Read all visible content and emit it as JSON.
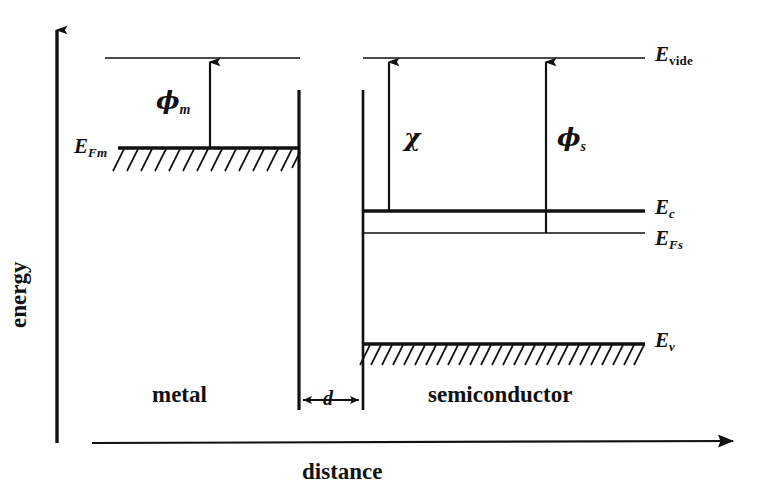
{
  "figure": {
    "type": "energy-band-diagram",
    "background_color": "#ffffff",
    "ink_color": "#111111"
  },
  "axes": {
    "energy_label": "energy",
    "distance_label": "distance",
    "energy_axis": {
      "x": 57,
      "y_top": 20,
      "y_bottom": 443
    },
    "distance_axis": {
      "y": 443,
      "x_left": 92,
      "x_right": 745
    }
  },
  "regions": {
    "metal": {
      "label": "metal",
      "label_x": 152,
      "label_y": 386,
      "x_left": 105,
      "x_right": 299
    },
    "gap": {
      "label": "d",
      "label_x": 322,
      "label_y": 389,
      "x_left": 299,
      "x_right": 363,
      "dim_line_y": 400
    },
    "semiconductor": {
      "label": "semiconductor",
      "label_x": 433,
      "label_y": 386,
      "x_left": 363,
      "x_right": 645
    }
  },
  "levels": [
    {
      "name": "E_vide_metal",
      "label_sym": "E",
      "label_sub": "",
      "y": 58,
      "x_start": 105,
      "x_end": 300,
      "thickness": 1.4,
      "hatched": false,
      "labeled": false
    },
    {
      "name": "E_vide_semiconductor",
      "label_sym": "E",
      "label_sub": "vide",
      "sub_upright": true,
      "y": 58,
      "x_start": 363,
      "x_end": 645,
      "thickness": 1.4,
      "hatched": false,
      "labeled": true,
      "label_x": 655,
      "label_y": 46
    },
    {
      "name": "E_Fm",
      "label_sym": "E",
      "label_sub": "Fm",
      "sub_upright": false,
      "y": 148,
      "x_start": 118,
      "x_end": 299,
      "thickness": 3.2,
      "hatched": true,
      "labeled": true,
      "label_x": 74,
      "label_y": 138
    },
    {
      "name": "E_c",
      "label_sym": "E",
      "label_sub": "c",
      "sub_upright": false,
      "y": 211,
      "x_start": 363,
      "x_end": 645,
      "thickness": 3.4,
      "hatched": false,
      "labeled": true,
      "label_x": 655,
      "label_y": 199
    },
    {
      "name": "E_Fs",
      "label_sym": "E",
      "label_sub": "Fs",
      "sub_upright": false,
      "y": 233,
      "x_start": 363,
      "x_end": 645,
      "thickness": 1.5,
      "hatched": false,
      "labeled": true,
      "label_x": 655,
      "label_y": 230
    },
    {
      "name": "E_v",
      "label_sym": "E",
      "label_sub": "v",
      "sub_upright": false,
      "y": 344,
      "x_start": 363,
      "x_end": 645,
      "thickness": 3.4,
      "hatched": true,
      "labeled": true,
      "label_x": 655,
      "label_y": 332
    }
  ],
  "boundaries": [
    {
      "name": "metal-surface",
      "x": 299,
      "y_top": 90,
      "y_bottom": 410
    },
    {
      "name": "semiconductor-surface",
      "x": 363,
      "y_top": 90,
      "y_bottom": 410
    }
  ],
  "arrows": [
    {
      "name": "phi-m",
      "symbol": "ϕ",
      "subscript": "m",
      "x": 210,
      "y_from": 148,
      "y_to": 58,
      "label_x": 158,
      "label_y": 90
    },
    {
      "name": "chi",
      "symbol": "χ",
      "subscript": "",
      "x": 389,
      "y_from": 211,
      "y_to": 58,
      "label_x": 404,
      "label_y": 128
    },
    {
      "name": "phi-s",
      "symbol": "ϕ",
      "subscript": "s",
      "x": 546,
      "y_from": 233,
      "y_to": 58,
      "label_x": 559,
      "label_y": 128
    }
  ],
  "hatching": {
    "metal": {
      "x_start": 122,
      "x_end": 298,
      "y": 148,
      "count": 13,
      "length": 22,
      "slant": 11
    },
    "valence": {
      "x_start": 366,
      "x_end": 644,
      "y": 344,
      "count": 26,
      "length": 20,
      "slant": 10
    }
  }
}
